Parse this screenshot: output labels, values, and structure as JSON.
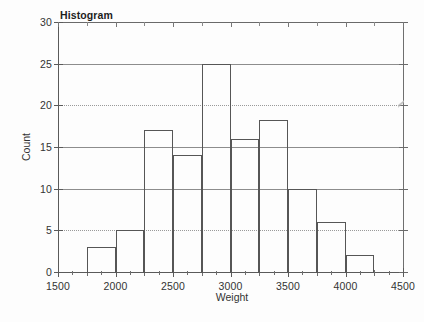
{
  "chart_data": {
    "type": "bar",
    "title": "Histogram",
    "xlabel": "Weight",
    "ylabel": "Count",
    "xlim": [
      1500,
      4500
    ],
    "ylim": [
      0,
      30
    ],
    "bin_width": 250,
    "grid": true,
    "legend": "none",
    "x_ticks": [
      {
        "value": 1500,
        "label": "1500",
        "major": true
      },
      {
        "value": 1750,
        "label": "",
        "major": false
      },
      {
        "value": 2000,
        "label": "2000",
        "major": true
      },
      {
        "value": 2250,
        "label": "",
        "major": false
      },
      {
        "value": 2500,
        "label": "2500",
        "major": true
      },
      {
        "value": 2750,
        "label": "",
        "major": false
      },
      {
        "value": 3000,
        "label": "3000",
        "major": true
      },
      {
        "value": 3250,
        "label": "",
        "major": false
      },
      {
        "value": 3500,
        "label": "3500",
        "major": true
      },
      {
        "value": 3750,
        "label": "",
        "major": false
      },
      {
        "value": 4000,
        "label": "4000",
        "major": true
      },
      {
        "value": 4250,
        "label": "",
        "major": false
      },
      {
        "value": 4500,
        "label": "4500",
        "major": true
      }
    ],
    "y_ticks": [
      {
        "value": 0,
        "label": "0",
        "gridline": "none"
      },
      {
        "value": 5,
        "label": "5",
        "gridline": "dotted"
      },
      {
        "value": 10,
        "label": "10",
        "gridline": "solid"
      },
      {
        "value": 15,
        "label": "15",
        "gridline": "solid"
      },
      {
        "value": 20,
        "label": "20",
        "gridline": "dotted"
      },
      {
        "value": 25,
        "label": "25",
        "gridline": "solid"
      },
      {
        "value": 30,
        "label": "30",
        "gridline": "none"
      }
    ],
    "bins": [
      {
        "x0": 1750,
        "x1": 2000,
        "count": 3
      },
      {
        "x0": 2000,
        "x1": 2250,
        "count": 5
      },
      {
        "x0": 2250,
        "x1": 2500,
        "count": 17
      },
      {
        "x0": 2500,
        "x1": 2750,
        "count": 14
      },
      {
        "x0": 2750,
        "x1": 3000,
        "count": 25
      },
      {
        "x0": 3000,
        "x1": 3250,
        "count": 16
      },
      {
        "x0": 3250,
        "x1": 3500,
        "count": 18.3
      },
      {
        "x0": 3500,
        "x1": 3750,
        "count": 10
      },
      {
        "x0": 3750,
        "x1": 4000,
        "count": 6
      },
      {
        "x0": 4000,
        "x1": 4250,
        "count": 2
      }
    ],
    "categories": [
      "1750-2000",
      "2000-2250",
      "2250-2500",
      "2500-2750",
      "2750-3000",
      "3000-3250",
      "3250-3500",
      "3500-3750",
      "3750-4000",
      "4000-4250"
    ],
    "values": [
      3,
      5,
      17,
      14,
      25,
      16,
      18.3,
      10,
      6,
      2
    ],
    "colors": {
      "bar_outline": "#565656",
      "bar_fill": "#ffffff",
      "axis": "#5a5a5a",
      "gridline": "#8d8d8d",
      "text": "#333333",
      "background": "#fdfdfd"
    }
  }
}
